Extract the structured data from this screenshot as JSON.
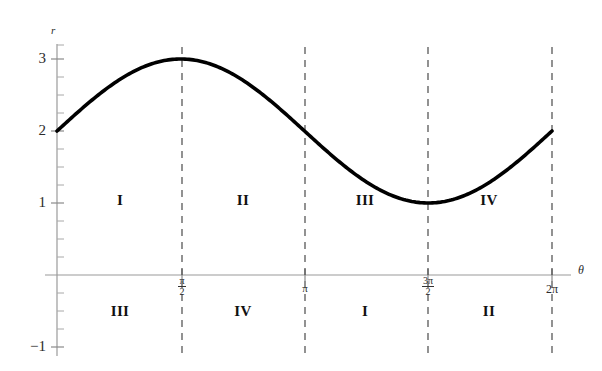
{
  "chart_data": {
    "type": "line",
    "title": "",
    "subtitle": "",
    "xlabel": "θ",
    "ylabel": "r",
    "function": "r = 2 + sin(θ)",
    "xlim": [
      0,
      6.283185307179586
    ],
    "ylim": [
      -1,
      3.4
    ],
    "grid": false,
    "legend": "none",
    "series": [
      {
        "name": "r = 2 + sin(theta)",
        "color": "#000000",
        "x": [
          0,
          0.3926990817,
          0.7853981634,
          1.1780972451,
          1.5707963268,
          1.9634954085,
          2.3561944902,
          2.7488935719,
          3.1415926536,
          3.5342917353,
          3.926990817,
          4.3196898987,
          4.7123889804,
          5.1050880621,
          5.4977871438,
          5.8904862255,
          6.2831853072
        ],
        "y": [
          2.0,
          2.3826834324,
          2.7071067812,
          2.9238795325,
          3.0,
          2.9238795325,
          2.7071067812,
          2.3826834324,
          2.0,
          1.6173165676,
          1.2928932188,
          1.0761204675,
          1.0,
          1.0761204675,
          1.2928932188,
          1.6173165676,
          2.0
        ]
      }
    ],
    "y_ticks": [
      {
        "value": 3,
        "label": "3"
      },
      {
        "value": 2,
        "label": "2"
      },
      {
        "value": 1,
        "label": "1"
      },
      {
        "value": -1,
        "label": "−1"
      }
    ],
    "y_minor_tick_step": 0.25,
    "x_ticks": [
      {
        "value": 1.5707963268,
        "label": "π/2",
        "num": "π",
        "den": "2"
      },
      {
        "value": 3.1415926536,
        "label": "π",
        "num": "",
        "den": ""
      },
      {
        "value": 4.7123889804,
        "label": "3π/2",
        "num": "3π",
        "den": "2"
      },
      {
        "value": 6.2831853072,
        "label": "2π",
        "num": "",
        "den": ""
      }
    ],
    "vertical_dashed_lines": [
      1.5707963268,
      3.1415926536,
      4.7123889804,
      6.2831853072
    ],
    "annotations": {
      "above_axis": [
        {
          "label": "I",
          "x_center": 0.7853981634,
          "y_center": 1.0
        },
        {
          "label": "II",
          "x_center": 2.3561944902,
          "y_center": 1.0
        },
        {
          "label": "III",
          "x_center": 3.926990817,
          "y_center": 1.0
        },
        {
          "label": "IV",
          "x_center": 5.4977871438,
          "y_center": 1.0
        }
      ],
      "below_axis": [
        {
          "label": "III",
          "x_center": 0.7853981634,
          "y_center": -0.62
        },
        {
          "label": "IV",
          "x_center": 2.3561944902,
          "y_center": -0.62
        },
        {
          "label": "I",
          "x_center": 3.926990817,
          "y_center": -0.62
        },
        {
          "label": "II",
          "x_center": 5.4977871438,
          "y_center": -0.62
        }
      ]
    },
    "colors": {
      "curve": "#000000",
      "axis": "#8a8a8a",
      "dashed": "#555555",
      "text": "#2b2b2b",
      "background": "#ffffff"
    }
  },
  "axis_labels": {
    "r": "r",
    "theta": "θ"
  },
  "y_tick_texts": {
    "t3": "3",
    "t2": "2",
    "t1": "1",
    "tm1": "−1"
  },
  "x_tick_texts": {
    "pi_over_2_num": "π",
    "pi_over_2_den": "2",
    "pi": "π",
    "three_pi_over_2_num": "3π",
    "three_pi_over_2_den": "2",
    "two_pi": "2π"
  },
  "regions_above": {
    "r1": "I",
    "r2": "II",
    "r3": "III",
    "r4": "IV"
  },
  "regions_below": {
    "r1": "III",
    "r2": "IV",
    "r3": "I",
    "r4": "II"
  }
}
